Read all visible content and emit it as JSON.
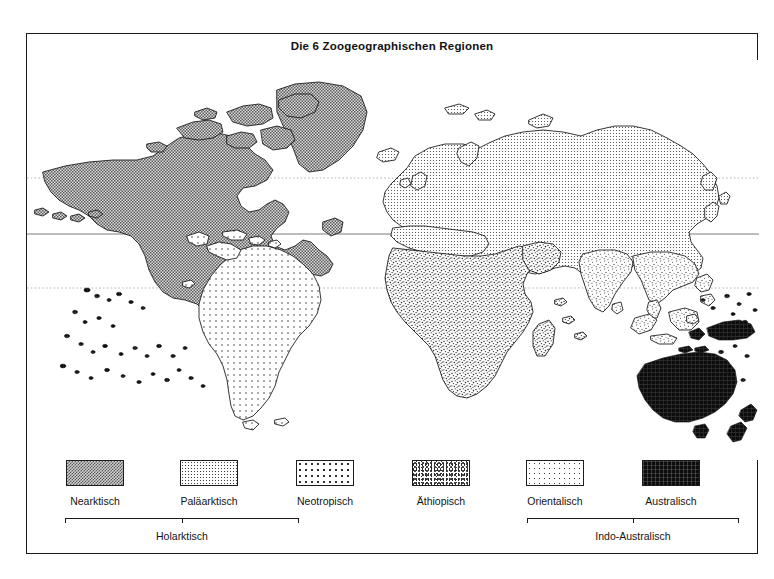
{
  "figure": {
    "title": "Die 6 Zoogeographischen Regionen"
  },
  "legend": {
    "items": [
      {
        "label": "Nearktisch",
        "key": "nearctic",
        "swatch": "dense-checker-gray"
      },
      {
        "label": "Paläarktisch",
        "key": "palearctic",
        "swatch": "fine-dot-grid"
      },
      {
        "label": "Neotropisch",
        "key": "neotropic",
        "swatch": "sparse-dot-grid"
      },
      {
        "label": "Äthiopisch",
        "key": "ethiopian",
        "swatch": "mottled-stipple"
      },
      {
        "label": "Orientalisch",
        "key": "oriental",
        "swatch": "light-stipple"
      },
      {
        "label": "Australisch",
        "key": "australian",
        "swatch": "solid-black"
      }
    ],
    "groups": [
      {
        "label": "Holarktisch",
        "covers": [
          "Nearktisch",
          "Paläarktisch"
        ]
      },
      {
        "label": "Indo-Australisch",
        "covers": [
          "Orientalisch",
          "Australisch"
        ]
      }
    ]
  },
  "map": {
    "projection": "world-equirectangular",
    "graticule": [
      {
        "name": "Tropic of Cancer",
        "style": "dotted"
      },
      {
        "name": "Equator",
        "style": "solid"
      },
      {
        "name": "Tropic of Capricorn",
        "style": "dotted"
      }
    ],
    "regions": [
      {
        "key": "nearctic",
        "areas": "North America, Greenland, Aleutians"
      },
      {
        "key": "palearctic",
        "areas": "Europe, North Asia, North Africa, Japan"
      },
      {
        "key": "neotropic",
        "areas": "South America, Central America, Caribbean"
      },
      {
        "key": "ethiopian",
        "areas": "Sub-Saharan Africa, Madagascar, Arabia"
      },
      {
        "key": "oriental",
        "areas": "India, Southeast Asia, Philippines, Western Indonesia"
      },
      {
        "key": "australian",
        "areas": "Australia, New Guinea, New Zealand, Pacific Islands"
      }
    ]
  },
  "colors": {
    "ink": "#1a1a1a",
    "nearctic": "#b9b9b9",
    "palearctic": "#f2f2f2",
    "neotropic": "#f7f7f7",
    "ethiopian": "#e4e4e4",
    "oriental": "#efefef",
    "australian": "#0d0d0d"
  }
}
